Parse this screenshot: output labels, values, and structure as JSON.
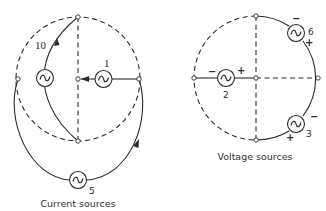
{
  "figure": {
    "left_panel": {
      "caption": "Current sources",
      "sources": [
        {
          "id": "source-1",
          "label": "1",
          "type": "current",
          "direction": "toward-center"
        },
        {
          "id": "source-10",
          "label": "10",
          "type": "current",
          "direction": "upward"
        },
        {
          "id": "source-5",
          "label": "5",
          "type": "current",
          "direction": "counterclockwise"
        }
      ]
    },
    "right_panel": {
      "caption": "Voltage sources",
      "sources": [
        {
          "id": "source-2",
          "label": "2",
          "type": "voltage",
          "minus": "−",
          "plus": "+"
        },
        {
          "id": "source-6",
          "label": "6",
          "type": "voltage",
          "minus": "−",
          "plus": "+"
        },
        {
          "id": "source-3",
          "label": "3",
          "type": "voltage",
          "minus": "−",
          "plus": "+"
        }
      ]
    },
    "icons": {
      "source_symbol": "ac-source-icon",
      "node_symbol": "node-circle-icon"
    },
    "colors": {
      "line": "#2a2a2a",
      "background": "#ffffff"
    }
  }
}
